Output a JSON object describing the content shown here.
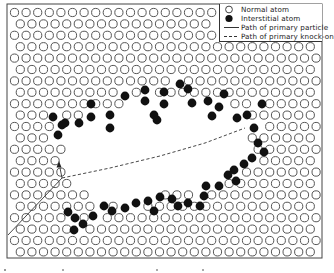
{
  "figure": {
    "frame": {
      "x": 7,
      "y": 4,
      "width": 315,
      "height": 254,
      "stroke": "#444444"
    },
    "lattice": {
      "origin_x": 14.5,
      "origin_y": 12.5,
      "dx": 11.6,
      "dy": 11.4,
      "rows": 22,
      "cols": 28,
      "radius": 4.1,
      "stroke": "#555555",
      "stroke_width": 1.0
    },
    "depleted_zone": [
      [
        62,
        152
      ],
      [
        60,
        132
      ],
      [
        72,
        118
      ],
      [
        96,
        112
      ],
      [
        120,
        104
      ],
      [
        150,
        100
      ],
      [
        178,
        92
      ],
      [
        208,
        96
      ],
      [
        232,
        104
      ],
      [
        248,
        118
      ],
      [
        252,
        138
      ],
      [
        250,
        160
      ],
      [
        240,
        172
      ],
      [
        222,
        176
      ],
      [
        200,
        182
      ],
      [
        176,
        190
      ],
      [
        150,
        196
      ],
      [
        122,
        198
      ],
      [
        96,
        196
      ],
      [
        74,
        186
      ],
      [
        64,
        172
      ]
    ],
    "interstitials": [
      [
        53,
        117
      ],
      [
        65,
        123
      ],
      [
        79,
        123
      ],
      [
        91,
        104
      ],
      [
        91,
        117
      ],
      [
        110,
        115
      ],
      [
        110,
        128
      ],
      [
        125,
        96
      ],
      [
        145,
        90
      ],
      [
        145,
        101
      ],
      [
        154,
        115
      ],
      [
        157,
        120
      ],
      [
        164,
        92
      ],
      [
        164,
        104
      ],
      [
        180,
        84
      ],
      [
        192,
        103
      ],
      [
        188,
        89
      ],
      [
        208,
        101
      ],
      [
        219,
        107
      ],
      [
        212,
        116
      ],
      [
        224,
        94
      ],
      [
        237,
        118
      ],
      [
        247,
        115
      ],
      [
        262,
        104
      ],
      [
        254,
        128
      ],
      [
        258,
        143
      ],
      [
        264,
        152
      ],
      [
        252,
        158
      ],
      [
        244,
        164
      ],
      [
        234,
        170
      ],
      [
        236,
        181
      ],
      [
        228,
        175
      ],
      [
        219,
        186
      ],
      [
        206,
        186
      ],
      [
        204,
        196
      ],
      [
        200,
        206
      ],
      [
        188,
        203
      ],
      [
        178,
        206
      ],
      [
        172,
        199
      ],
      [
        160,
        197
      ],
      [
        154,
        211
      ],
      [
        148,
        201
      ],
      [
        136,
        203
      ],
      [
        125,
        208
      ],
      [
        112,
        211
      ],
      [
        104,
        206
      ],
      [
        93,
        216
      ],
      [
        83,
        224
      ],
      [
        75,
        218
      ],
      [
        68,
        212
      ],
      [
        74,
        230
      ],
      [
        58,
        135
      ],
      [
        62,
        125
      ]
    ],
    "primary_particle_path": [
      [
        8,
        235
      ],
      [
        62,
        178
      ],
      [
        60,
        168
      ]
    ],
    "knock_on_path": [
      [
        62,
        178
      ],
      [
        110,
        168
      ],
      [
        160,
        156
      ],
      [
        205,
        143
      ],
      [
        245,
        128
      ]
    ],
    "arrowhead": {
      "x": 59,
      "y": 166
    },
    "colors": {
      "atom_stroke": "#555555",
      "interstitial_fill": "#111111",
      "line": "#333333"
    }
  },
  "legend": {
    "items": [
      {
        "symbol": "open-circle",
        "label": "Normal atom"
      },
      {
        "symbol": "filled-circle",
        "label": "Interstitial atom"
      },
      {
        "symbol": "solid-line",
        "label": "Path of primary particle"
      },
      {
        "symbol": "dashed-line",
        "label": "Path of primary knock-on"
      }
    ]
  }
}
